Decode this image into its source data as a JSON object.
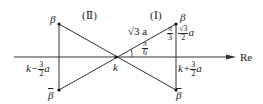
{
  "diagram": {
    "axis_label": "Re",
    "region_I": "(Ⅰ)",
    "region_II": "(Ⅱ)",
    "point_k": "k",
    "beta": "β",
    "beta_bar": "β",
    "left_x_label_prefix": "k−",
    "left_x_label_num": "3",
    "left_x_label_den": "2",
    "left_x_label_suffix": "a",
    "right_x_label_prefix": "k+",
    "right_x_label_num": "3",
    "right_x_label_den": "2",
    "right_x_label_suffix": "a",
    "hyp_label": "√3 a",
    "angle_label_num": "π",
    "angle_label_den": "6",
    "top_angle_num": "π",
    "top_angle_den": "3",
    "height_label_num": "√3",
    "height_label_den": "2",
    "height_label_suffix": "a"
  }
}
